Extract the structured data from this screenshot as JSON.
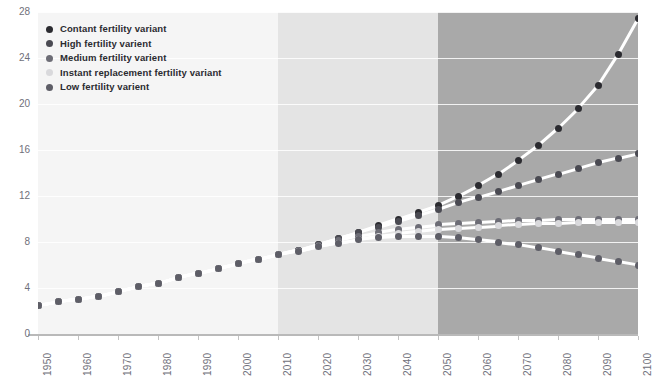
{
  "header": {
    "clipped_caption": ""
  },
  "legend": {
    "position": "top-left",
    "items": [
      {
        "label": "Contant fertility variant",
        "color": "#2b2b30",
        "name": "constant"
      },
      {
        "label": "High fertility varient",
        "color": "#4a4a52",
        "name": "high"
      },
      {
        "label": "Medium fertility varient",
        "color": "#6d6d76",
        "name": "medium"
      },
      {
        "label": "Instant replacement fertility variant",
        "color": "#d9d9dc",
        "name": "instant"
      },
      {
        "label": "Low fertility varient",
        "color": "#5e5e67",
        "name": "low"
      }
    ]
  },
  "axes": {
    "y_ticks": [
      "0",
      "4",
      "8",
      "12",
      "16",
      "20",
      "24",
      "28"
    ],
    "x_ticks": [
      "1950",
      "1960",
      "1970",
      "1980",
      "1990",
      "2000",
      "2010",
      "2020",
      "2030",
      "2040",
      "2050",
      "2060",
      "2070",
      "2080",
      "2090",
      "2100"
    ]
  },
  "bands": [
    {
      "name": "historical",
      "from": 1950,
      "to": 2010,
      "color": "#f5f5f5"
    },
    {
      "name": "near-projection",
      "from": 2010,
      "to": 2050,
      "color": "#e4e4e4"
    },
    {
      "name": "far-projection",
      "from": 2050,
      "to": 2100,
      "color": "#a9a9a9"
    }
  ],
  "chart_data": {
    "type": "line",
    "title": "",
    "subtitle": "",
    "xlabel": "",
    "ylabel": "",
    "xlim": [
      1950,
      2100
    ],
    "ylim": [
      0,
      28
    ],
    "grid": true,
    "legend_position": "top-left",
    "x": [
      1950,
      1955,
      1960,
      1965,
      1970,
      1975,
      1980,
      1985,
      1990,
      1995,
      2000,
      2005,
      2010,
      2015,
      2020,
      2025,
      2030,
      2035,
      2040,
      2045,
      2050,
      2055,
      2060,
      2065,
      2070,
      2075,
      2080,
      2085,
      2090,
      2095,
      2100
    ],
    "series": [
      {
        "name": "Contant fertility variant",
        "color": "#2b2b30",
        "values": [
          2.5,
          2.8,
          3.0,
          3.3,
          3.7,
          4.1,
          4.4,
          4.9,
          5.3,
          5.7,
          6.1,
          6.5,
          6.9,
          7.3,
          7.8,
          8.3,
          8.8,
          9.4,
          10.0,
          10.6,
          11.2,
          12.0,
          12.9,
          13.9,
          15.1,
          16.4,
          17.9,
          19.6,
          21.6,
          24.3,
          27.4
        ]
      },
      {
        "name": "High fertility varient",
        "color": "#4a4a52",
        "values": [
          2.5,
          2.8,
          3.0,
          3.3,
          3.7,
          4.1,
          4.4,
          4.9,
          5.3,
          5.7,
          6.1,
          6.5,
          6.9,
          7.3,
          7.8,
          8.3,
          8.8,
          9.3,
          9.8,
          10.3,
          10.8,
          11.4,
          11.9,
          12.4,
          12.9,
          13.4,
          13.9,
          14.4,
          14.9,
          15.3,
          15.7
        ]
      },
      {
        "name": "Medium fertility varient",
        "color": "#6d6d76",
        "values": [
          2.5,
          2.8,
          3.0,
          3.3,
          3.7,
          4.1,
          4.4,
          4.9,
          5.3,
          5.7,
          6.1,
          6.5,
          6.9,
          7.3,
          7.7,
          8.1,
          8.5,
          8.8,
          9.1,
          9.3,
          9.5,
          9.6,
          9.7,
          9.8,
          9.9,
          9.9,
          10.0,
          10.0,
          10.0,
          10.0,
          10.0
        ]
      },
      {
        "name": "Instant replacement fertility variant",
        "color": "#d9d9dc",
        "values": [
          2.5,
          2.8,
          3.0,
          3.3,
          3.7,
          4.1,
          4.4,
          4.9,
          5.3,
          5.7,
          6.1,
          6.5,
          6.9,
          7.2,
          7.6,
          7.9,
          8.2,
          8.5,
          8.7,
          8.9,
          9.1,
          9.2,
          9.3,
          9.4,
          9.5,
          9.6,
          9.6,
          9.7,
          9.7,
          9.7,
          9.7
        ]
      },
      {
        "name": "Low fertility varient",
        "color": "#5e5e67",
        "values": [
          2.5,
          2.8,
          3.0,
          3.3,
          3.7,
          4.1,
          4.4,
          4.9,
          5.3,
          5.7,
          6.1,
          6.5,
          6.9,
          7.2,
          7.6,
          7.9,
          8.2,
          8.4,
          8.5,
          8.5,
          8.5,
          8.4,
          8.2,
          8.0,
          7.8,
          7.5,
          7.2,
          6.9,
          6.6,
          6.3,
          6.0
        ]
      }
    ]
  }
}
